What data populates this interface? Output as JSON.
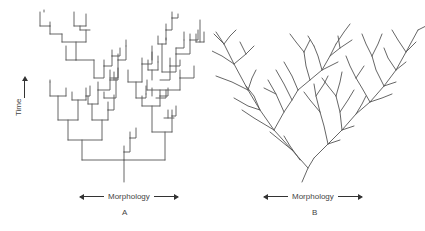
{
  "figure": {
    "panels": [
      {
        "id": "A",
        "label": "A",
        "style": "rectangular-cladogram",
        "x_axis_label": "Morphology",
        "y_axis_label": "Time"
      },
      {
        "id": "B",
        "label": "B",
        "style": "diagonal-branching-tree",
        "x_axis_label": "Morphology"
      }
    ],
    "line_color": "#555555",
    "background": "#ffffff"
  }
}
